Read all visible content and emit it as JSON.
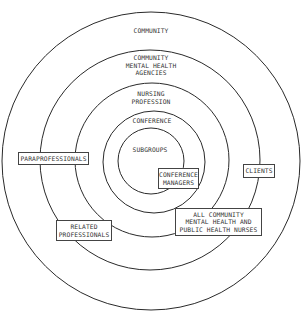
{
  "diagram": {
    "type": "concentric-circles",
    "rings": [
      {
        "id": "community",
        "label": "COMMUNITY",
        "cx": 151,
        "cy": 161,
        "r": 149
      },
      {
        "id": "mental-health-agencies",
        "label": "COMMUNITY\nMENTAL HEALTH\nAGENCIES",
        "cx": 150,
        "cy": 160,
        "r": 110
      },
      {
        "id": "nursing-profession",
        "label": "NURSING\nPROFESSION",
        "cx": 152,
        "cy": 160,
        "r": 77
      },
      {
        "id": "conference",
        "label": "CONFERENCE",
        "cx": 154,
        "cy": 162,
        "r": 51
      },
      {
        "id": "subgroups",
        "label": "SUBGROUPS",
        "cx": 151,
        "cy": 161,
        "r": 33
      }
    ],
    "ring_labels": {
      "community": "COMMUNITY",
      "mental_health_agencies": "COMMUNITY\nMENTAL HEALTH\nAGENCIES",
      "nursing_profession": "NURSING\nPROFESSION",
      "conference": "CONFERENCE",
      "subgroups": "SUBGROUPS"
    },
    "boxes": {
      "paraprofessionals": "PARAPROFESSIONALS",
      "conference_managers": "CONFERENCE\nMANAGERS",
      "clients": "CLIENTS",
      "related_professionals": "RELATED\nPROFESSIONALS",
      "all_nurses": "ALL COMMUNITY\nMENTAL HEALTH AND\nPUBLIC HEALTH NURSES"
    },
    "colors": {
      "stroke": "#2a2a2a",
      "text": "#333333",
      "background": "#ffffff"
    }
  }
}
